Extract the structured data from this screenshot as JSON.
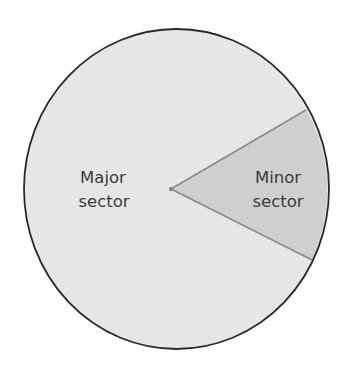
{
  "diagram": {
    "type": "circle-sectors",
    "colors": {
      "background": "#ffffff",
      "major_fill": "#e6e6e6",
      "minor_fill": "#cfcfcf",
      "outline": "#2a2a2a",
      "radius_lines": "#8a8a8a",
      "center_dot": "#8a8a8a",
      "text": "#3a3a3a"
    },
    "circle": {
      "cx": 176.5,
      "cy": 189,
      "rx": 152.5,
      "ry": 160
    },
    "center_point": {
      "x": 171,
      "y": 189
    },
    "minor_sector_endpoints": [
      {
        "x": 306,
        "y": 110
      },
      {
        "x": 312,
        "y": 260
      }
    ],
    "labels": {
      "major": {
        "line1": "Major",
        "line2": "sector"
      },
      "minor": {
        "line1": "Minor",
        "line2": "sector"
      }
    }
  }
}
